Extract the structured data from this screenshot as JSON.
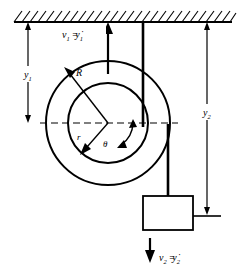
{
  "figure": {
    "background_color": "#ffffff",
    "line_color": "#000000"
  },
  "ceiling": {
    "name": "fixed-support",
    "hatching": "diagonal-hatch",
    "y": 22,
    "x_start": 14,
    "x_end": 232,
    "hatch_count": 26
  },
  "pulley": {
    "center_x": 108,
    "center_y": 123,
    "outer_radius": 62,
    "inner_radius": 40,
    "labels": {
      "outer_radius": "R",
      "inner_radius": "r",
      "angle": "θ"
    }
  },
  "centerline": {
    "name": "horizontal-centerline",
    "style": "dashed",
    "x_start": 40,
    "x_end": 178,
    "y": 123
  },
  "dimensions": [
    {
      "name": "y1",
      "label": "y",
      "subscript": "1",
      "x": 28,
      "y_top": 22,
      "y_bottom": 123,
      "label_x": 28,
      "label_y": 74
    },
    {
      "name": "y2",
      "label": "y",
      "subscript": "2",
      "x": 207,
      "y_top": 22,
      "y_bottom": 215,
      "label_x": 207,
      "label_y": 112
    }
  ],
  "velocities": [
    {
      "name": "v1",
      "text": "v",
      "subscript": "1",
      "equals": "=",
      "rate": "y",
      "rate_subscript": "1",
      "rate_dot": "̇",
      "full_text": "v₁ = ỹ₁",
      "direction": "up",
      "arrow_x": 108,
      "arrow_y_tail": 72,
      "arrow_y_head": 25,
      "label_x": 70,
      "label_y": 36
    },
    {
      "name": "v2",
      "text": "v",
      "subscript": "2",
      "equals": "=",
      "rate": "y",
      "rate_subscript": "2",
      "rate_dot": "̇",
      "full_text": "v₂ = ỹ₂",
      "direction": "down",
      "arrow_x": 150,
      "arrow_y_tail": 238,
      "arrow_y_head": 262,
      "label_x": 160,
      "label_y": 258
    }
  ],
  "cords": [
    {
      "name": "cord-left-inner",
      "from_x": 143,
      "from_y": 22,
      "to_x": 143,
      "to_y": 126,
      "width": 2.6,
      "attach": "inner-drum-tangent"
    },
    {
      "name": "cord-right-outer",
      "from_x": 168,
      "from_y": 126,
      "to_x": 168,
      "to_y": 196,
      "width": 2.6,
      "attach": "outer-rim-tangent"
    }
  ],
  "block": {
    "name": "hanging-block",
    "x": 143,
    "y": 196,
    "width": 50,
    "height": 34,
    "fill": "#ffffff",
    "stroke": "#000000"
  }
}
